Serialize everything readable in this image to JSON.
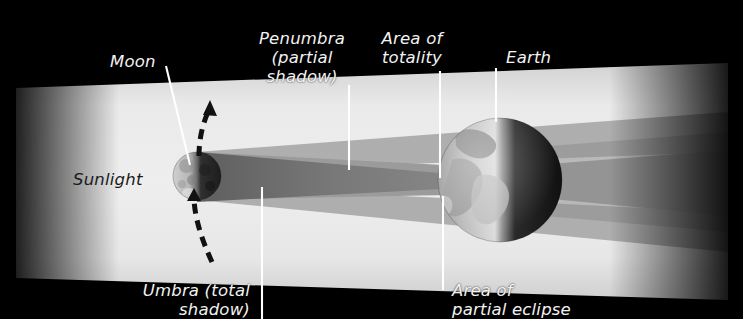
{
  "diagram": {
    "background_color": "#000000",
    "labels": {
      "moon": "Moon",
      "penumbra": "Penumbra\n(partial\nshadow)",
      "area_of_totality": "Area of\ntotality",
      "earth": "Earth",
      "sunlight": "Sunlight",
      "umbra": "Umbra (total\nshadow)",
      "area_of_partial_eclipse": "Area of\npartial eclipse"
    },
    "colors": {
      "background": "#000000",
      "sunlight_beam": "#e9e9e9",
      "penumbra_band": "#9a9a9a",
      "umbra_cone": "#6f6f6f",
      "leader_line": "#ffffff",
      "label_light": "#f2f2f2",
      "label_dark": "#1b1b1b",
      "moon_lit": "#d8d8d8",
      "moon_dark": "#2e2e2e",
      "earth_lit": "#cfcfcf",
      "earth_dark": "#141414"
    },
    "bodies": {
      "moon": {
        "name": "Moon",
        "cx": 197,
        "cy": 176,
        "r": 24
      },
      "earth": {
        "name": "Earth",
        "cx": 500,
        "cy": 180,
        "r": 62
      }
    },
    "orbit_arrow": {
      "name": "moon-orbit-direction",
      "style": "dashed",
      "direction": "upward"
    }
  }
}
